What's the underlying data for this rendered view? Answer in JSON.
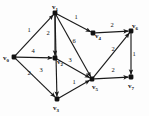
{
  "figure": {
    "name": "weighted-directed-graph",
    "background_color": "#fdfdfd",
    "line_color": "#1a1a1a",
    "width": 149,
    "height": 116
  },
  "vertices": [
    {
      "id": "v0",
      "label": "v",
      "sub": "0",
      "x": 14,
      "y": 57,
      "label_x": 3,
      "label_y": 60
    },
    {
      "id": "v1",
      "label": "v",
      "sub": "1",
      "x": 55,
      "y": 13,
      "label_x": 52,
      "label_y": 9
    },
    {
      "id": "v2",
      "label": "v",
      "sub": "2",
      "x": 55,
      "y": 58,
      "label_x": 57,
      "label_y": 64
    },
    {
      "id": "v3",
      "label": "v",
      "sub": "3",
      "x": 57,
      "y": 99,
      "label_x": 53,
      "label_y": 110
    },
    {
      "id": "v4",
      "label": "v",
      "sub": "4",
      "x": 93,
      "y": 33,
      "label_x": 95,
      "label_y": 38
    },
    {
      "id": "v5",
      "label": "v",
      "sub": "5",
      "x": 92,
      "y": 79,
      "label_x": 92,
      "label_y": 89
    },
    {
      "id": "v6",
      "label": "v",
      "sub": "6",
      "x": 131,
      "y": 31,
      "label_x": 132,
      "label_y": 28
    },
    {
      "id": "v7",
      "label": "v",
      "sub": "7",
      "x": 131,
      "y": 77,
      "label_x": 128,
      "label_y": 88
    }
  ],
  "edges": [
    {
      "id": "e-v0-v1",
      "from": "v0",
      "to": "v1",
      "weight": "1",
      "wx": 29,
      "wy": 32
    },
    {
      "id": "e-v1-v2",
      "from": "v1",
      "to": "v2",
      "weight": "2",
      "wx": 48,
      "wy": 35
    },
    {
      "id": "e-v1-v3",
      "from": "v1",
      "to": "v3",
      "weight": "3",
      "wx": 41,
      "wy": 72
    },
    {
      "id": "e-v1-v4",
      "from": "v1",
      "to": "v4",
      "weight": "1",
      "wx": 76,
      "wy": 19
    },
    {
      "id": "e-v1-v5",
      "from": "v1",
      "to": "v5",
      "weight": "6",
      "wx": 74,
      "wy": 43
    },
    {
      "id": "e-v0-v2",
      "from": "v0",
      "to": "v2",
      "weight": "4",
      "wx": 33,
      "wy": 53
    },
    {
      "id": "e-v0-v3",
      "from": "v0",
      "to": "v3",
      "weight": "2",
      "wx": 29,
      "wy": 75
    },
    {
      "id": "e-v2-v5",
      "from": "v2",
      "to": "v5",
      "weight": "3",
      "wx": 70,
      "wy": 62
    },
    {
      "id": "e-v3-v5",
      "from": "v3",
      "to": "v5",
      "weight": "1",
      "wx": 74,
      "wy": 84
    },
    {
      "id": "e-v4-v6",
      "from": "v4",
      "to": "v6",
      "weight": "2",
      "wx": 112,
      "wy": 27
    },
    {
      "id": "e-v5-v6",
      "from": "v5",
      "to": "v6",
      "weight": "2",
      "wx": 113,
      "wy": 51
    },
    {
      "id": "e-v5-v7",
      "from": "v5",
      "to": "v7",
      "weight": "2",
      "wx": 113,
      "wy": 72
    },
    {
      "id": "e-v6-v7",
      "from": "v6",
      "to": "v7",
      "weight": "1",
      "wx": 134,
      "wy": 56
    }
  ]
}
